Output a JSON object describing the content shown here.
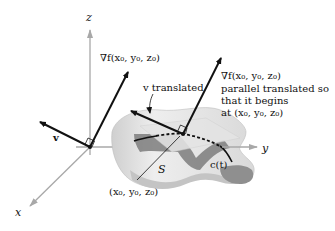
{
  "diagram": {
    "type": "3d-gradient-normal-illustration",
    "axes": {
      "x_label": "x",
      "y_label": "y",
      "z_label": "z"
    },
    "labels": {
      "grad_left": "∇f(x₀, y₀, z₀)",
      "v_left": "v",
      "v_translated": "v translated",
      "grad_right_line1": "∇f(x₀, y₀, z₀)",
      "grad_right_line2": "parallel translated so",
      "grad_right_line3": "that it begins",
      "grad_right_line4": "at (x₀, y₀, z₀)",
      "surface": "S",
      "point": "(x₀, y₀, z₀)",
      "curve": "c(t)"
    },
    "colors": {
      "axis": "#a8a8a8",
      "vector": "#111111",
      "surface_light": "#ececec",
      "surface_mid": "#cfcfcf",
      "surface_dark": "#8a8a8a",
      "tangent_plane": "#dedede"
    }
  }
}
